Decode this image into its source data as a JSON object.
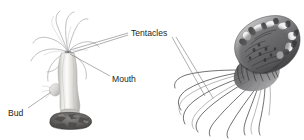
{
  "figure": {
    "background_color": "#ffffff",
    "width": 304,
    "height": 140,
    "label_color": "#231f20",
    "leader_line_color": "#6e6e72"
  },
  "labels": {
    "tentacles": "Tentacles",
    "mouth": "Mouth",
    "bud": "Bud"
  },
  "organisms": {
    "polyp": {
      "name": "hydra-polyp",
      "body_color": "#d8d7d4",
      "body_highlight": "#f4f4f2",
      "body_shadow": "#a9a8a6",
      "tentacle_color": "#b9b9bb",
      "base_rock_color": "#6b6967",
      "base_rock_dark": "#4a4846",
      "bud_color": "#cfcecb"
    },
    "medusa": {
      "name": "jellyfish-medusa",
      "bell_color": "#8e8e90",
      "bell_highlight": "#f2f2f2",
      "bell_dark": "#3a3a3c",
      "tentacle_color": "#4e4e50",
      "oral_arm_color": "#5c5c5e"
    }
  }
}
